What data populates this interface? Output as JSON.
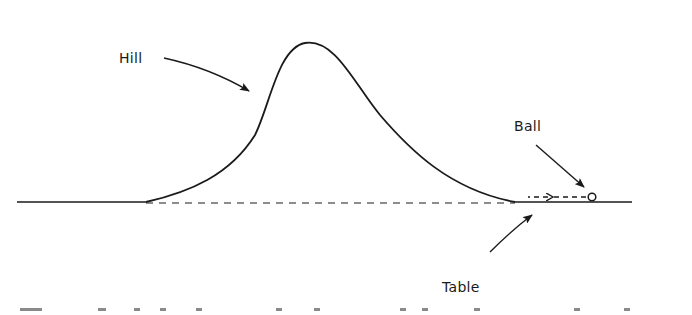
{
  "figure": {
    "type": "physics-diagram",
    "labels": {
      "hill": "Hill",
      "ball": "Ball",
      "table": "Table"
    },
    "colors": {
      "ink": "#1a1a1a",
      "background": "#ffffff"
    }
  }
}
